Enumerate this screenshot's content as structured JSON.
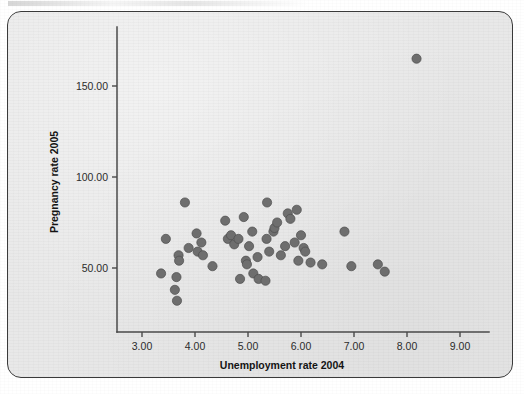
{
  "figure": {
    "frame": {
      "border_color": "#3a3a3a",
      "background_color": "#e8e8e8"
    }
  },
  "chart_data": {
    "type": "scatter",
    "title": "",
    "subtitle": "",
    "xlabel": "Unemployment rate 2004",
    "ylabel": "Pregnancy rate 2005",
    "xlim": [
      2.62,
      9.38
    ],
    "ylim": [
      13.0,
      178.0
    ],
    "xticks": [
      3.0,
      4.0,
      5.0,
      6.0,
      7.0,
      8.0,
      9.0
    ],
    "xtick_labels": [
      "3.00",
      "4.00",
      "5.00",
      "6.00",
      "7.00",
      "8.00",
      "9.00"
    ],
    "yticks": [
      50.0,
      100.0,
      150.0
    ],
    "ytick_labels": [
      "50.00",
      "100.00",
      "150.00"
    ],
    "grid": false,
    "legend": false,
    "legend_position": "none",
    "marker_color": "#6e6e6e",
    "marker_edge_color": "#4e4e4e",
    "marker_size": 4.6,
    "n_points": 52,
    "series": [
      {
        "name": "States",
        "points": [
          [
            3.36,
            47.0
          ],
          [
            3.45,
            66.0
          ],
          [
            3.62,
            38.0
          ],
          [
            3.65,
            45.0
          ],
          [
            3.66,
            32.0
          ],
          [
            3.69,
            57.0
          ],
          [
            3.7,
            54.0
          ],
          [
            3.81,
            86.0
          ],
          [
            3.88,
            61.0
          ],
          [
            4.03,
            69.0
          ],
          [
            4.05,
            59.0
          ],
          [
            4.12,
            64.0
          ],
          [
            4.15,
            57.0
          ],
          [
            4.33,
            51.0
          ],
          [
            4.57,
            76.0
          ],
          [
            4.62,
            66.0
          ],
          [
            4.68,
            68.0
          ],
          [
            4.74,
            63.0
          ],
          [
            4.82,
            66.0
          ],
          [
            4.85,
            44.0
          ],
          [
            4.92,
            78.0
          ],
          [
            4.96,
            54.0
          ],
          [
            4.98,
            52.0
          ],
          [
            5.02,
            62.0
          ],
          [
            5.08,
            70.0
          ],
          [
            5.1,
            47.0
          ],
          [
            5.18,
            56.0
          ],
          [
            5.2,
            44.0
          ],
          [
            5.33,
            43.0
          ],
          [
            5.35,
            66.0
          ],
          [
            5.36,
            86.0
          ],
          [
            5.4,
            59.0
          ],
          [
            5.48,
            70.0
          ],
          [
            5.5,
            72.0
          ],
          [
            5.55,
            75.0
          ],
          [
            5.62,
            57.0
          ],
          [
            5.7,
            62.0
          ],
          [
            5.75,
            80.0
          ],
          [
            5.8,
            77.0
          ],
          [
            5.88,
            64.0
          ],
          [
            5.92,
            82.0
          ],
          [
            5.95,
            54.0
          ],
          [
            6.0,
            68.0
          ],
          [
            6.05,
            61.0
          ],
          [
            6.08,
            59.0
          ],
          [
            6.18,
            53.0
          ],
          [
            6.4,
            52.0
          ],
          [
            6.82,
            70.0
          ],
          [
            6.95,
            51.0
          ],
          [
            7.45,
            52.0
          ],
          [
            7.58,
            48.0
          ],
          [
            8.18,
            165.0
          ]
        ]
      }
    ]
  }
}
